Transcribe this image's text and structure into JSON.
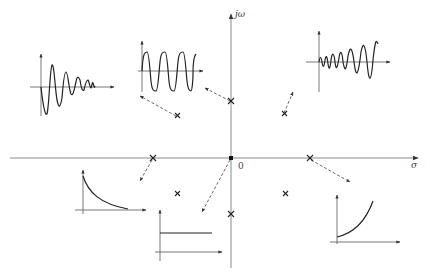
{
  "diagram": {
    "title": "",
    "axes": {
      "horizontal_label": "σ",
      "vertical_label": "jω",
      "origin_label": "0"
    },
    "poles": [
      {
        "id": "origin",
        "x": 231,
        "y": 158,
        "response": "constant"
      },
      {
        "id": "imag-upper",
        "x": 231,
        "y": 101,
        "response": "sustained-oscillation"
      },
      {
        "id": "imag-lower",
        "x": 231,
        "y": 214,
        "response": "sustained-oscillation"
      },
      {
        "id": "real-negative",
        "x": 153,
        "y": 158,
        "response": "decaying-exponential"
      },
      {
        "id": "real-positive",
        "x": 310,
        "y": 158,
        "response": "growing-exponential"
      },
      {
        "id": "lhp-upper",
        "x": 177,
        "y": 115,
        "response": "sustained-oscillation-arrow"
      },
      {
        "id": "lhp-lower",
        "x": 178,
        "y": 194,
        "response": "decaying-oscillation"
      },
      {
        "id": "rhp-upper",
        "x": 285,
        "y": 114,
        "response": "growing-oscillation"
      },
      {
        "id": "rhp-lower",
        "x": 286,
        "y": 194,
        "response": "growing-oscillation"
      }
    ],
    "insets": [
      {
        "id": "decaying-oscillation",
        "label": "decaying oscillation"
      },
      {
        "id": "sustained-oscillation",
        "label": "sustained oscillation"
      },
      {
        "id": "growing-oscillation",
        "label": "growing oscillation"
      },
      {
        "id": "decaying-exponential",
        "label": "decaying exponential"
      },
      {
        "id": "constant",
        "label": "constant"
      },
      {
        "id": "growing-exponential",
        "label": "growing exponential"
      }
    ],
    "colors": {
      "axis": "#8a8a8a",
      "curve": "#222222",
      "background": "#ffffff"
    }
  }
}
